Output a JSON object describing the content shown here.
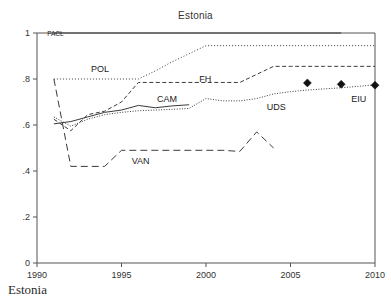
{
  "figure": {
    "title": "Estonia",
    "caption": "Estonia"
  },
  "chart_data": {
    "type": "line",
    "title": "Estonia",
    "xlabel": "",
    "ylabel": "",
    "xlim": [
      1990,
      2010
    ],
    "ylim": [
      0,
      1
    ],
    "xticks": [
      1990,
      1995,
      2000,
      2005,
      2010
    ],
    "xtick_labels": [
      "1990",
      "1995",
      "2000",
      "2005",
      "2010"
    ],
    "yticks": [
      0,
      0.2,
      0.4,
      0.6,
      0.8,
      1
    ],
    "ytick_labels": [
      "0",
      ".2",
      ".4",
      ".6",
      ".8",
      "1"
    ],
    "grid": false,
    "legend_position": "inline-annotations",
    "series": [
      {
        "name": "PACL",
        "label": "PACL",
        "style": "solid",
        "marker": "none",
        "color": "#3a3a3a",
        "label_position": {
          "x": 1990.6,
          "y": 1.0
        },
        "x": [
          1991,
          1992,
          1993,
          1994,
          1995,
          1996,
          1997,
          1998,
          1999,
          2000,
          2001,
          2002,
          2003,
          2004,
          2005,
          2006,
          2007,
          2008
        ],
        "y": [
          1.0,
          1.0,
          1.0,
          1.0,
          1.0,
          1.0,
          1.0,
          1.0,
          1.0,
          1.0,
          1.0,
          1.0,
          1.0,
          1.0,
          1.0,
          1.0,
          1.0,
          1.0
        ]
      },
      {
        "name": "POL",
        "label": "POL",
        "style": "dotted",
        "marker": "none",
        "color": "#3a3a3a",
        "label_position": {
          "x": 1993.2,
          "y": 0.845
        },
        "x": [
          1991,
          1992,
          1993,
          1994,
          1995,
          1996,
          1997,
          1998,
          1999,
          2000,
          2001,
          2002,
          2003,
          2004,
          2005,
          2006,
          2007,
          2008,
          2009,
          2010
        ],
        "y": [
          0.8,
          0.8,
          0.8,
          0.8,
          0.8,
          0.8,
          0.835,
          0.875,
          0.91,
          0.945,
          0.945,
          0.945,
          0.945,
          0.945,
          0.945,
          0.945,
          0.945,
          0.945,
          0.945,
          0.945
        ]
      },
      {
        "name": "FH",
        "label": "FH",
        "style": "dashed",
        "marker": "none",
        "color": "#3a3a3a",
        "label_position": {
          "x": 1999.6,
          "y": 0.8
        },
        "x": [
          1991,
          1992,
          1993,
          1994,
          1995,
          1996,
          1997,
          1998,
          1999,
          2000,
          2001,
          2002,
          2003,
          2004,
          2005,
          2006,
          2007,
          2008,
          2009,
          2010
        ],
        "y": [
          0.625,
          0.575,
          0.645,
          0.66,
          0.7,
          0.785,
          0.785,
          0.785,
          0.785,
          0.785,
          0.785,
          0.785,
          0.82,
          0.855,
          0.855,
          0.855,
          0.855,
          0.855,
          0.855,
          0.855
        ]
      },
      {
        "name": "CAM",
        "label": "CAM",
        "style": "solid",
        "marker": "none",
        "color": "#3a3a3a",
        "label_position": {
          "x": 1997.1,
          "y": 0.715
        },
        "x": [
          1991,
          1992,
          1993,
          1994,
          1995,
          1996,
          1997,
          1998,
          1999
        ],
        "y": [
          0.605,
          0.615,
          0.635,
          0.655,
          0.665,
          0.685,
          0.675,
          0.683,
          0.688
        ]
      },
      {
        "name": "UDS",
        "label": "UDS",
        "style": "dashdot",
        "marker": "none",
        "color": "#3a3a3a",
        "label_position": {
          "x": 2003.6,
          "y": 0.678
        },
        "x": [
          1991,
          1992,
          1993,
          1994,
          1995,
          1996,
          1997,
          1998,
          1999,
          2000,
          2001,
          2002,
          2003,
          2004,
          2005,
          2006,
          2007,
          2008,
          2009,
          2010
        ],
        "y": [
          0.635,
          0.595,
          0.625,
          0.645,
          0.655,
          0.662,
          0.665,
          0.668,
          0.672,
          0.715,
          0.705,
          0.705,
          0.715,
          0.735,
          0.745,
          0.752,
          0.757,
          0.762,
          0.768,
          0.775
        ]
      },
      {
        "name": "VAN",
        "label": "VAN",
        "style": "longdash",
        "marker": "none",
        "color": "#3a3a3a",
        "label_position": {
          "x": 1995.6,
          "y": 0.443
        },
        "x": [
          1991,
          1992,
          1993,
          1994,
          1995,
          1996,
          1997,
          1998,
          1999,
          2000,
          2001,
          2002,
          2003,
          2004
        ],
        "y": [
          0.8,
          0.42,
          0.42,
          0.42,
          0.49,
          0.49,
          0.49,
          0.49,
          0.49,
          0.49,
          0.49,
          0.485,
          0.57,
          0.5
        ]
      },
      {
        "name": "EIU",
        "label": "EIU",
        "style": "none",
        "marker": "diamond",
        "color": "#111111",
        "label_position": {
          "x": 2008.6,
          "y": 0.715
        },
        "x": [
          2006,
          2008,
          2010
        ],
        "y": [
          0.783,
          0.777,
          0.773
        ]
      }
    ]
  }
}
